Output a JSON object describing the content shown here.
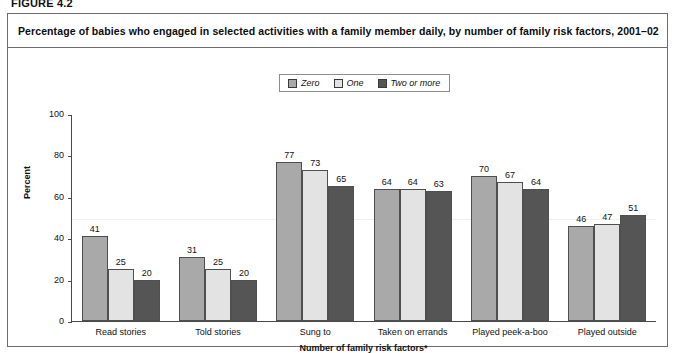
{
  "figure_label": "FIGURE 4.2",
  "title": "Percentage of babies who engaged in selected activities with a family member daily, by number of family risk factors, 2001–02",
  "legend": {
    "items": [
      {
        "label": "Zero",
        "color": "#a9a9a9"
      },
      {
        "label": "One",
        "color": "#e3e3e3"
      },
      {
        "label": "Two or more",
        "color": "#555555"
      }
    ]
  },
  "chart_data": {
    "type": "bar",
    "title": "Percentage of babies who engaged in selected activities with a family member daily, by number of family risk factors, 2001–02",
    "xlabel": "Number of family risk factors*",
    "ylabel": "Percent",
    "ylim": [
      0,
      100
    ],
    "yticks": [
      0,
      20,
      40,
      60,
      80,
      100
    ],
    "grid": false,
    "legend_position": "top-center",
    "categories": [
      "Read stories",
      "Told stories",
      "Sung to",
      "Taken on errands",
      "Played peek-a-boo",
      "Played outside"
    ],
    "series": [
      {
        "name": "Zero",
        "color": "#a9a9a9",
        "values": [
          41,
          31,
          77,
          64,
          70,
          46
        ]
      },
      {
        "name": "One",
        "color": "#e3e3e3",
        "values": [
          25,
          25,
          73,
          64,
          67,
          47
        ]
      },
      {
        "name": "Two or more",
        "color": "#555555",
        "values": [
          20,
          20,
          65,
          63,
          64,
          51
        ]
      }
    ]
  }
}
